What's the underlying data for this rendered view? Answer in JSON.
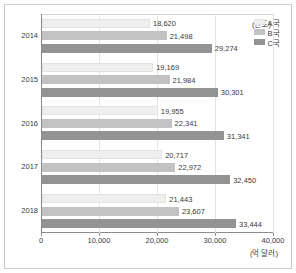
{
  "chart_data": {
    "type": "bar",
    "orientation": "horizontal",
    "title": "",
    "xlabel": "(억 달러)",
    "ylabel": "(연도)",
    "categories": [
      "2014",
      "2015",
      "2016",
      "2017",
      "2018"
    ],
    "series": [
      {
        "name": "A국",
        "color": "#efefef",
        "values": [
          18620,
          19169,
          19955,
          20717,
          21443
        ],
        "labels": [
          "18,620",
          "19,169",
          "19,955",
          "20,717",
          "21,443"
        ]
      },
      {
        "name": "B국",
        "color": "#c2c2c2",
        "values": [
          21498,
          21984,
          22341,
          22972,
          23607
        ],
        "labels": [
          "21,498",
          "21,984",
          "22,341",
          "22,972",
          "23,607"
        ]
      },
      {
        "name": "C국",
        "color": "#939393",
        "values": [
          29274,
          30301,
          31341,
          32450,
          33444
        ],
        "labels": [
          "29,274",
          "30,301",
          "31,341",
          "32,450",
          "33,444"
        ]
      }
    ],
    "xlim": [
      0,
      40000
    ],
    "xticks": [
      0,
      10000,
      20000,
      30000,
      40000
    ],
    "xtick_labels": [
      "0",
      "10,000",
      "20,000",
      "30,000",
      "40,000"
    ],
    "grid": true,
    "legend_position": "top-right"
  },
  "legend": {
    "items": [
      {
        "label": "A국"
      },
      {
        "label": "B국"
      },
      {
        "label": "C국"
      }
    ]
  }
}
